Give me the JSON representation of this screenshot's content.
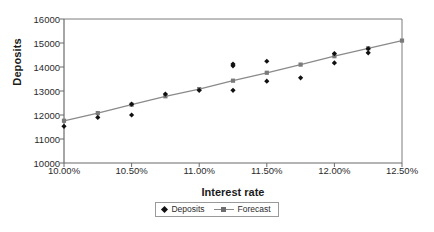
{
  "chart_data": {
    "type": "scatter",
    "title": "",
    "xlabel": "Interest rate",
    "ylabel": "Deposits",
    "xlim": [
      10.0,
      12.5
    ],
    "ylim": [
      10000,
      16000
    ],
    "grid": false,
    "legend_position": "bottom-center",
    "xticks": [
      "10.00%",
      "10.50%",
      "11.00%",
      "11.50%",
      "12.00%",
      "12.50%"
    ],
    "xtick_values": [
      10.0,
      10.5,
      11.0,
      11.5,
      12.0,
      12.5
    ],
    "yticks": [
      "10000",
      "11000",
      "12000",
      "13000",
      "14000",
      "15000",
      "16000"
    ],
    "ytick_values": [
      10000,
      11000,
      12000,
      13000,
      14000,
      15000,
      16000
    ],
    "series": [
      {
        "name": "Deposits",
        "marker": "diamond",
        "color": "#111111",
        "x": [
          10.0,
          10.25,
          10.5,
          10.5,
          10.75,
          11.0,
          11.25,
          11.25,
          11.25,
          11.5,
          11.5,
          11.75,
          12.0,
          12.0,
          12.25,
          12.25
        ],
        "y": [
          11530,
          11900,
          12450,
          12000,
          12870,
          13030,
          14120,
          14050,
          13030,
          14240,
          13410,
          13550,
          14560,
          14170,
          14760,
          14590
        ]
      },
      {
        "name": "Forecast",
        "marker": "square",
        "color": "#7a7a7a",
        "line_color": "#8a8a8a",
        "x": [
          10.0,
          10.25,
          10.5,
          10.75,
          11.0,
          11.25,
          11.5,
          11.75,
          12.0,
          12.25,
          12.5
        ],
        "y": [
          11760,
          12080,
          12430,
          12780,
          13080,
          13430,
          13760,
          14100,
          14450,
          14780,
          15100
        ]
      }
    ]
  },
  "axes": {
    "y_title": "Deposits",
    "x_title": "Interest rate"
  },
  "legend": {
    "items": [
      {
        "label": "Deposits",
        "marker": "diamond-marker"
      },
      {
        "label": "Forecast",
        "marker": "line-square-marker"
      }
    ]
  },
  "colors": {
    "deposits": "#111111",
    "forecast_line": "#8a8a8a",
    "forecast_marker": "#7a7a7a",
    "axis": "#6b6b6b",
    "text": "#2b2b2b"
  }
}
